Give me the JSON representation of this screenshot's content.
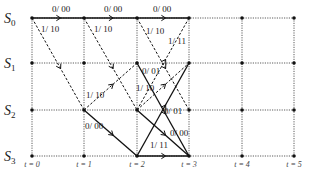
{
  "states": [
    {
      "name": "S",
      "sub": "0"
    },
    {
      "name": "S",
      "sub": "1"
    },
    {
      "name": "S",
      "sub": "2"
    },
    {
      "name": "S",
      "sub": "3"
    }
  ],
  "time_labels": [
    "t = 0",
    "t = 1",
    "t = 2",
    "t = 3",
    "t = 4",
    "t = 5"
  ],
  "grid": {
    "x": [
      32,
      84,
      137,
      189,
      242,
      294
    ],
    "y": [
      18,
      63,
      110,
      156
    ]
  },
  "edges": [
    {
      "from": [
        0,
        0
      ],
      "to": [
        1,
        0
      ],
      "style": "solid",
      "label": "0/00",
      "lx": 52,
      "ly": 12
    },
    {
      "from": [
        0,
        0
      ],
      "to": [
        1,
        2
      ],
      "style": "dashed",
      "label": "1/10",
      "lx": 41,
      "ly": 32
    },
    {
      "from": [
        1,
        0
      ],
      "to": [
        2,
        0
      ],
      "style": "solid",
      "label": "0/00",
      "lx": 104,
      "ly": 12
    },
    {
      "from": [
        1,
        0
      ],
      "to": [
        2,
        2
      ],
      "style": "dashed",
      "label": "1/10",
      "lx": 94,
      "ly": 32
    },
    {
      "from": [
        1,
        2
      ],
      "to": [
        2,
        1
      ],
      "style": "dashed",
      "label": "1/10",
      "lx": 86,
      "ly": 98
    },
    {
      "from": [
        1,
        2
      ],
      "to": [
        2,
        3
      ],
      "style": "solid",
      "label": "0/00",
      "lx": 85,
      "ly": 129
    },
    {
      "from": [
        2,
        0
      ],
      "to": [
        3,
        0
      ],
      "style": "solid",
      "label": "0/00",
      "lx": 153,
      "ly": 12
    },
    {
      "from": [
        2,
        0
      ],
      "to": [
        3,
        2
      ],
      "style": "dashed",
      "label": "1/10",
      "lx": 146,
      "ly": 34
    },
    {
      "from": [
        2,
        1
      ],
      "to": [
        3,
        3
      ],
      "style": "solid",
      "label": "0/01",
      "lx": 142,
      "ly": 74
    },
    {
      "from": [
        2,
        2
      ],
      "to": [
        3,
        0
      ],
      "style": "dashed",
      "label": "1/11",
      "lx": 168,
      "ly": 44
    },
    {
      "from": [
        2,
        2
      ],
      "to": [
        3,
        1
      ],
      "style": "dashed",
      "label": "1/10",
      "lx": 136,
      "ly": 91
    },
    {
      "from": [
        2,
        2
      ],
      "to": [
        3,
        3
      ],
      "style": "solid",
      "label": "0/00",
      "lx": 170,
      "ly": 136
    },
    {
      "from": [
        2,
        3
      ],
      "to": [
        3,
        1
      ],
      "style": "solid",
      "label": "0/01",
      "lx": 164,
      "ly": 114
    },
    {
      "from": [
        2,
        3
      ],
      "to": [
        3,
        3
      ],
      "style": "solid",
      "label": "1/11",
      "lx": 150,
      "ly": 148
    }
  ]
}
